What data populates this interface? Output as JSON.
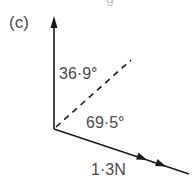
{
  "diagram": {
    "part_label": "(c)",
    "top_fragment": "g",
    "angles": {
      "upper": "36·9°",
      "lower": "69·5°"
    },
    "force": {
      "label": "1·3N",
      "magnitude": 1.3,
      "unit": "N"
    },
    "colors": {
      "line": "#1a1a1a",
      "text": "#4a4a4a"
    },
    "elements": {
      "vertical_axis": "vertical arrow pointing up",
      "force_vector": "diagonal arrow pointing down-right with two arrowheads",
      "resultant": "dashed line at angle between axes"
    }
  }
}
